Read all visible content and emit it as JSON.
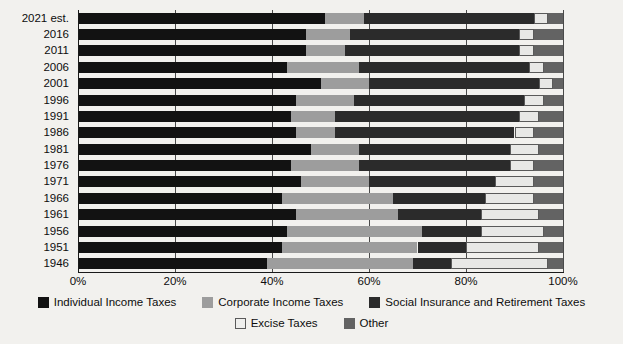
{
  "chart_data": {
    "type": "bar",
    "orientation": "horizontal",
    "stacked": true,
    "stack_mode": "percent",
    "title": "",
    "subtitle": "",
    "xlabel": "",
    "ylabel": "",
    "xlim": [
      0,
      100
    ],
    "grid": true,
    "legend_position": "bottom",
    "xticks": [
      "0%",
      "20%",
      "40%",
      "60%",
      "80%",
      "100%"
    ],
    "xtick_values": [
      0,
      20,
      40,
      60,
      80,
      100
    ],
    "categories": [
      "2021 est.",
      "2016",
      "2011",
      "2006",
      "2001",
      "1996",
      "1991",
      "1986",
      "1981",
      "1976",
      "1971",
      "1966",
      "1961",
      "1956",
      "1951",
      "1946"
    ],
    "series": [
      {
        "name": "Individual Income Taxes",
        "color": "#121212",
        "values": [
          51,
          47,
          47,
          43,
          50,
          45,
          44,
          45,
          48,
          44,
          46,
          42,
          45,
          43,
          42,
          39
        ]
      },
      {
        "name": "Corporate Income Taxes",
        "color": "#9d9d9d",
        "values": [
          8,
          9,
          8,
          15,
          10,
          12,
          9,
          8,
          10,
          14,
          14,
          23,
          21,
          28,
          28,
          30
        ]
      },
      {
        "name": "Social Insurance and Retirement Taxes",
        "color": "#2b2b2b",
        "values": [
          35,
          35,
          36,
          35,
          35,
          35,
          38,
          37,
          31,
          31,
          26,
          19,
          17,
          12,
          10,
          8
        ]
      },
      {
        "name": "Excise Taxes",
        "color": "#e8e8e6",
        "values": [
          3,
          3,
          3,
          3,
          3,
          4,
          4,
          4,
          6,
          5,
          8,
          10,
          12,
          13,
          15,
          20
        ]
      },
      {
        "name": "Other",
        "color": "#636363",
        "values": [
          3,
          6,
          6,
          4,
          2,
          4,
          5,
          6,
          5,
          6,
          6,
          6,
          5,
          4,
          5,
          3
        ]
      }
    ]
  },
  "legend": {
    "rows": [
      [
        {
          "label": "Individual Income Taxes",
          "swatch": "sw-individual",
          "icon": "legend-swatch-individual-income-taxes"
        },
        {
          "label": "Corporate Income Taxes",
          "swatch": "sw-corporate",
          "icon": "legend-swatch-corporate-income-taxes"
        },
        {
          "label": "Social Insurance and Retirement Taxes",
          "swatch": "sw-social",
          "icon": "legend-swatch-social-insurance"
        }
      ],
      [
        {
          "label": "Excise Taxes",
          "swatch": "sw-excise",
          "icon": "legend-swatch-excise-taxes"
        },
        {
          "label": "Other",
          "swatch": "sw-other",
          "icon": "legend-swatch-other"
        }
      ]
    ]
  }
}
